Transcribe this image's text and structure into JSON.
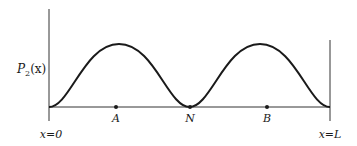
{
  "figure": {
    "y_axis_label": "P",
    "y_axis_subscript": "2",
    "y_axis_arg": "(x)",
    "left_boundary_label": "x=0",
    "right_boundary_label": "x=L",
    "points": [
      {
        "label": "A"
      },
      {
        "label": "N"
      },
      {
        "label": "B"
      }
    ],
    "stroke_color": "#1a1a1a"
  }
}
